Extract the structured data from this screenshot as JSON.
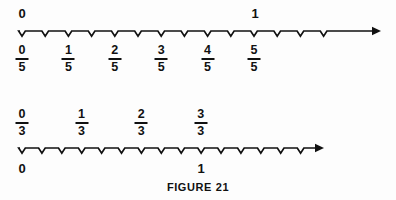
{
  "figure": {
    "caption": "FIGURE  21",
    "caption_y": 181,
    "background_color": "#fdfdfd",
    "ink_color": "#111111"
  },
  "chart_data": {
    "type": "line",
    "title": "FIGURE 21",
    "subtitle": "Two number lines showing equivalent fraction partitions",
    "xlabel": "",
    "ylabel": "",
    "grid": false,
    "legend": null,
    "number_lines": [
      {
        "id": "fifths-number-line",
        "name": "number-line-fifths",
        "denominator": 5,
        "axis_y": 31,
        "x_start": 22,
        "x_end": 372,
        "tick_spacing": 23.2,
        "tick_count": 14,
        "tick_style": "v-notch-below",
        "arrow_end": "right",
        "labels_above": [
          {
            "text": "0",
            "x": 22
          },
          {
            "text": "1",
            "x": 255
          }
        ],
        "labels_below_fractions": [
          {
            "numerator": "0",
            "denominator": "5",
            "x": 22,
            "value": 0
          },
          {
            "numerator": "1",
            "denominator": "5",
            "x": 68.4,
            "value": 0.2
          },
          {
            "numerator": "2",
            "denominator": "5",
            "x": 114.8,
            "value": 0.4
          },
          {
            "numerator": "3",
            "denominator": "5",
            "x": 161.2,
            "value": 0.6
          },
          {
            "numerator": "4",
            "denominator": "5",
            "x": 207.6,
            "value": 0.8
          },
          {
            "numerator": "5",
            "denominator": "5",
            "x": 254,
            "value": 1.0
          }
        ]
      },
      {
        "id": "thirds-number-line",
        "name": "number-line-thirds",
        "denominator": 3,
        "axis_y": 148,
        "x_start": 22,
        "x_end": 315,
        "tick_spacing": 19.9,
        "tick_count": 15,
        "tick_style": "v-notch-below",
        "arrow_end": "right",
        "labels_above_fractions": [
          {
            "numerator": "0",
            "denominator": "3",
            "x": 22,
            "value": 0
          },
          {
            "numerator": "1",
            "denominator": "3",
            "x": 81.6,
            "value": 0.3333
          },
          {
            "numerator": "2",
            "denominator": "3",
            "x": 141.2,
            "value": 0.6667
          },
          {
            "numerator": "3",
            "denominator": "3",
            "x": 200.8,
            "value": 1.0
          }
        ],
        "labels_below": [
          {
            "text": "0",
            "x": 22
          },
          {
            "text": "1",
            "x": 201
          }
        ]
      }
    ]
  }
}
